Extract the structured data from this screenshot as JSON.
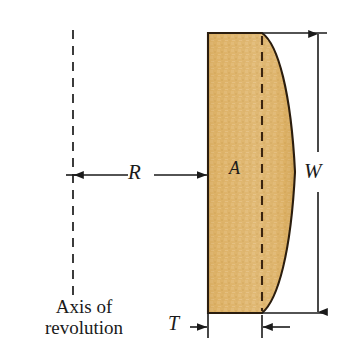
{
  "figure": {
    "type": "engineering-dimension-diagram",
    "background_color": "#ffffff",
    "line_color": "#1a1a1a",
    "shape": {
      "name": "cross-section-area",
      "fill_color": "#ddb165",
      "fill_color_light": "#e8c489",
      "outline_color": "#2b1d0e",
      "description": "Flat-left, curved-right crescent/lens cross section"
    },
    "labels": {
      "radius": "R",
      "width": "W",
      "area": "A",
      "thickness": "T",
      "axis_line1": "Axis of",
      "axis_line2": "revolution"
    },
    "dimensions": {
      "radius_label": "R",
      "radius_description": "Horizontal distance from axis of revolution to the left face of the section",
      "width_label": "W",
      "width_description": "Overall vertical height of the section",
      "thickness_label": "T",
      "thickness_description": "Horizontal thickness measured at the flat left portion",
      "area_label": "A",
      "area_description": "Cross-sectional area of the shaded region"
    },
    "axis": {
      "name": "axis-of-revolution",
      "style": "dashed vertical line",
      "x": 73,
      "y_top": 30,
      "y_bottom": 296
    },
    "geometry": {
      "shape_left_x": 208,
      "shape_flat_right_x": 262,
      "shape_curve_max_x": 296,
      "shape_top_y": 33,
      "shape_bottom_y": 313,
      "w_dim_x": 318,
      "interior_dashed_x": 262
    }
  }
}
